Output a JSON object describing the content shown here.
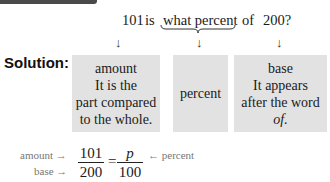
{
  "question": {
    "amount": "101",
    "is": "is",
    "what_percent": "what percent",
    "of": "of",
    "base": "200?"
  },
  "solution_label": "Solution:",
  "arrow_down": "↓",
  "boxes": [
    {
      "title": "amount",
      "lines": [
        "It is the",
        "part compared",
        "to the whole."
      ]
    },
    {
      "title": "percent",
      "lines": []
    },
    {
      "title": "base",
      "lines": [
        "It appears",
        "after the word"
      ],
      "italic_line": "of."
    }
  ],
  "proportion": {
    "amount_label": "amount →",
    "base_label": "base →",
    "percent_label": "← percent",
    "left_numerator": "101",
    "left_denominator": "200",
    "equals": "=",
    "right_numerator": "p",
    "right_denominator": "100"
  },
  "colors": {
    "box_fill": "#e2e2e2",
    "label_gray": "#777777",
    "top_bar": "#4a4a4a"
  }
}
